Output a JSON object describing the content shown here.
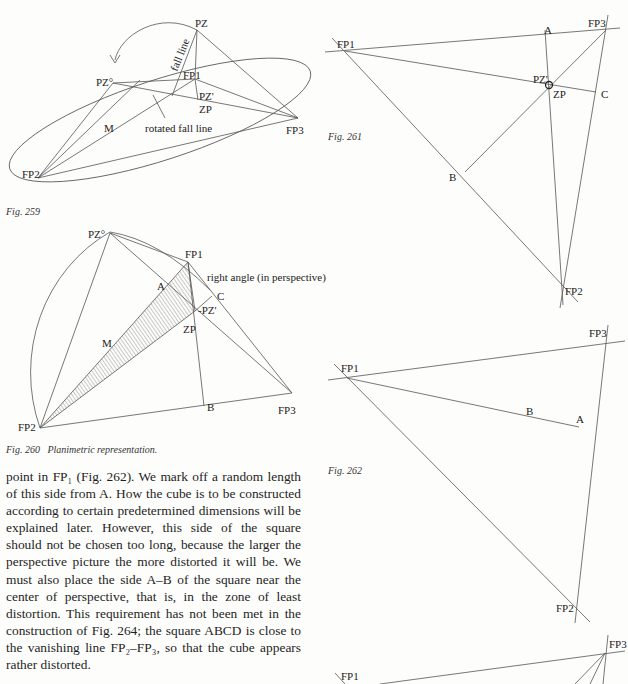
{
  "figures": {
    "fig259": {
      "caption": "Fig. 259",
      "labels": {
        "pz": "PZ",
        "pz0": "PZ°",
        "fp1": "FP1",
        "fp2": "FP2",
        "fp3": "FP3",
        "pz_prime": "PZ'",
        "zp": "ZP",
        "m": "M",
        "fall_line": "fall line",
        "rotated_fall_line": "rotated fall line"
      }
    },
    "fig260": {
      "caption": "Fig. 260   Planimetric representation.",
      "labels": {
        "pz0": "PZ°",
        "fp1": "FP1",
        "fp2": "FP2",
        "fp3": "FP3",
        "a": "A",
        "b": "B",
        "c": "C",
        "pz_prime": "-PZ'",
        "zp": "ZP",
        "m": "M",
        "right_angle": "right angle (in perspective)"
      }
    },
    "fig261": {
      "caption": "Fig. 261",
      "labels": {
        "fp1": "FP1",
        "fp2": "FP2",
        "fp3": "FP3",
        "a": "A",
        "b": "B",
        "c": "C",
        "pz_prime": "PZ'",
        "zp": "ZP"
      }
    },
    "fig262": {
      "caption": "Fig. 262",
      "labels": {
        "fp1": "FP1",
        "fp2": "FP2",
        "fp3": "FP3",
        "a": "A",
        "b": "B"
      }
    },
    "fig263_partial": {
      "labels": {
        "fp1": "FP1",
        "fp3": "FP3"
      }
    }
  },
  "body": {
    "paragraph": "point in FP₁ (Fig. 262). We mark off a random length of this side from A. How the cube is to be constructed according to certain predetermined dimensions will be explained later. However, this side of the square should not be chosen too long, because the larger the perspective picture the more distorted it will be. We must also place the side A–B of the square near the center of perspective, that is, in the zone of least distortion. This requirement has not been met in the construction of Fig. 264; the square ABCD is close to the vanishing line FP₂–FP₃, so that the cube appears rather distorted."
  }
}
